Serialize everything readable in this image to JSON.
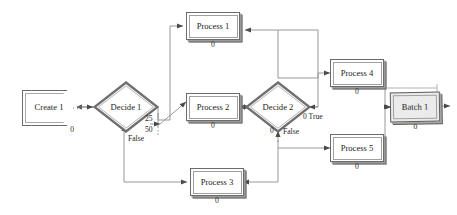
{
  "diagram": {
    "colors": {
      "background": "#ffffff",
      "module_border": "#6b6b6b",
      "module_fill": "#ffffff",
      "batch_fill": "#ebebeb",
      "wire": "#8c8c8c",
      "text": "#1c1c1c"
    },
    "modules": [
      {
        "id": "create1",
        "type": "create",
        "label": "Create 1",
        "count": "0"
      },
      {
        "id": "decide1",
        "type": "decide",
        "label": "Decide 1",
        "count": ""
      },
      {
        "id": "process1",
        "type": "process",
        "label": "Process 1",
        "count": "0"
      },
      {
        "id": "process2",
        "type": "process",
        "label": "Process 2",
        "count": "0"
      },
      {
        "id": "process3",
        "type": "process",
        "label": "Process 3",
        "count": "0"
      },
      {
        "id": "decide2",
        "type": "decide",
        "label": "Decide 2",
        "count": ""
      },
      {
        "id": "process4",
        "type": "process",
        "label": "Process 4",
        "count": "0"
      },
      {
        "id": "process5",
        "type": "process",
        "label": "Process 5",
        "count": "0"
      },
      {
        "id": "batch1",
        "type": "batch",
        "label": "Batch 1",
        "count": "0"
      }
    ],
    "connector_labels": {
      "decide1_branch_25": "25",
      "decide1_branch_50": "50",
      "decide1_false": "False",
      "decide2_true": "0 True",
      "decide2_false_count": "0",
      "decide2_false": "False"
    }
  }
}
